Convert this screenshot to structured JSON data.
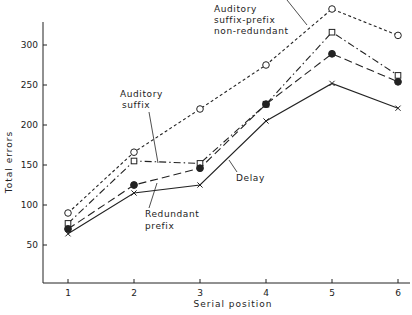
{
  "chart_data": {
    "type": "line",
    "title": "",
    "xlabel": "Serial position",
    "ylabel": "Total errors",
    "x": [
      1,
      2,
      3,
      4,
      5,
      6
    ],
    "xticks": [
      "1",
      "2",
      "3",
      "4",
      "5",
      "6"
    ],
    "yticks": [
      50,
      100,
      150,
      200,
      250,
      300
    ],
    "ylim": [
      0,
      325
    ],
    "grid": false,
    "legend": "inline annotations",
    "series": [
      {
        "name": "Auditory suffix-prefix non-redundant",
        "marker": "open-circle",
        "linestyle": "short-dash",
        "values": [
          90,
          166,
          220,
          275,
          345,
          312
        ]
      },
      {
        "name": "Auditory suffix",
        "marker": "open-square",
        "linestyle": "dash-dot",
        "values": [
          77,
          155,
          152,
          226,
          316,
          262
        ]
      },
      {
        "name": "Redundant prefix",
        "marker": "filled-circle",
        "linestyle": "long-dash",
        "values": [
          70,
          125,
          146,
          226,
          289,
          254
        ]
      },
      {
        "name": "Delay",
        "marker": "cross",
        "linestyle": "solid",
        "values": [
          64,
          115,
          125,
          205,
          252,
          221
        ]
      }
    ],
    "annotations": [
      {
        "series": "Auditory suffix-prefix non-redundant",
        "lines": [
          "Auditory",
          "suffix-prefix",
          "non-redundant"
        ]
      },
      {
        "series": "Auditory suffix",
        "lines": [
          "Auditory",
          "suffix"
        ]
      },
      {
        "series": "Redundant prefix",
        "lines": [
          "Redundant",
          "prefix"
        ]
      },
      {
        "series": "Delay",
        "lines": [
          "Delay"
        ]
      }
    ]
  },
  "colors": {
    "ink": "#222222",
    "background": "#ffffff"
  }
}
